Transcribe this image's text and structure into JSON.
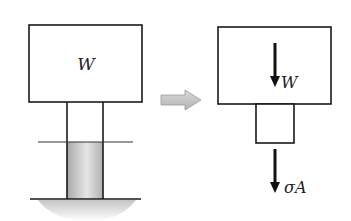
{
  "diagram": {
    "left": {
      "block_label": "W",
      "description": "Weight W resting on a column cut by a horizontal section plane"
    },
    "transition_arrow": {
      "direction": "right",
      "color": "#c8c8c8"
    },
    "right": {
      "load_label": "W",
      "reaction_label": "σA",
      "description": "Free-body diagram of block and column segment"
    },
    "colors": {
      "stroke": "#1a1a1a",
      "column_shade": "#b8b8b8",
      "ground_shadow": "#cfcfcf"
    }
  }
}
